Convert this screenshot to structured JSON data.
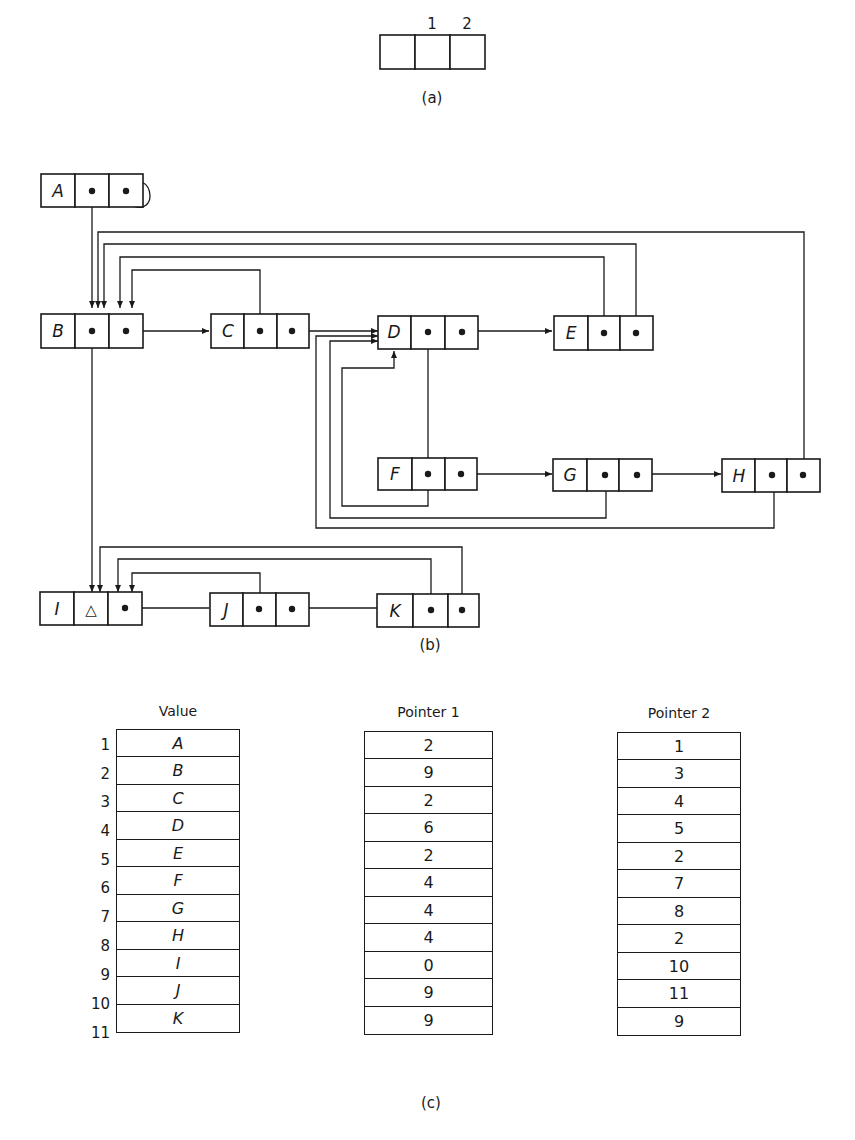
{
  "figure_a": {
    "caption": "(a)",
    "field_labels": [
      "",
      "1",
      "2"
    ]
  },
  "figure_b": {
    "caption": "(b)",
    "nodes": [
      {
        "id": "A",
        "value": "A",
        "pointer1": "B",
        "pointer2": "A"
      },
      {
        "id": "B",
        "value": "B",
        "pointer1": "I",
        "pointer2": "C"
      },
      {
        "id": "C",
        "value": "C",
        "pointer1": "B",
        "pointer2": "D"
      },
      {
        "id": "D",
        "value": "D",
        "pointer1": "F",
        "pointer2": "E"
      },
      {
        "id": "E",
        "value": "E",
        "pointer1": "B",
        "pointer2": "B"
      },
      {
        "id": "F",
        "value": "F",
        "pointer1": "D",
        "pointer2": "G"
      },
      {
        "id": "G",
        "value": "G",
        "pointer1": "D",
        "pointer2": "H"
      },
      {
        "id": "H",
        "value": "H",
        "pointer1": "D",
        "pointer2": "B"
      },
      {
        "id": "I",
        "value": "I",
        "pointer1": "null",
        "pointer2": "J"
      },
      {
        "id": "J",
        "value": "J",
        "pointer1": "I",
        "pointer2": "K"
      },
      {
        "id": "K",
        "value": "K",
        "pointer1": "I",
        "pointer2": "I"
      }
    ],
    "null_symbol": "△"
  },
  "figure_c": {
    "caption": "(c)",
    "headers": {
      "value": "Value",
      "pointer1": "Pointer 1",
      "pointer2": "Pointer 2"
    },
    "rows": [
      {
        "index": "1",
        "value": "A",
        "pointer1": "2",
        "pointer2": "1"
      },
      {
        "index": "2",
        "value": "B",
        "pointer1": "9",
        "pointer2": "3"
      },
      {
        "index": "3",
        "value": "C",
        "pointer1": "2",
        "pointer2": "4"
      },
      {
        "index": "4",
        "value": "D",
        "pointer1": "6",
        "pointer2": "5"
      },
      {
        "index": "5",
        "value": "E",
        "pointer1": "2",
        "pointer2": "2"
      },
      {
        "index": "6",
        "value": "F",
        "pointer1": "4",
        "pointer2": "7"
      },
      {
        "index": "7",
        "value": "G",
        "pointer1": "4",
        "pointer2": "8"
      },
      {
        "index": "8",
        "value": "H",
        "pointer1": "4",
        "pointer2": "2"
      },
      {
        "index": "9",
        "value": "I",
        "pointer1": "0",
        "pointer2": "10"
      },
      {
        "index": "10",
        "value": "J",
        "pointer1": "9",
        "pointer2": "11"
      },
      {
        "index": "11",
        "value": "K",
        "pointer1": "9",
        "pointer2": "9"
      }
    ]
  }
}
